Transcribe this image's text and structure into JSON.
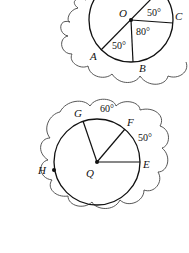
{
  "diagram": {
    "top_circle": {
      "center_label": "O",
      "points": {
        "A": "A",
        "B": "B",
        "C": "C"
      },
      "angles": {
        "upper_right": "50°",
        "right_lower": "80°",
        "lower_left": "50°"
      }
    },
    "bottom_circle": {
      "center_label": "Q",
      "points": {
        "E": "E",
        "F": "F",
        "G": "G",
        "H": "H"
      },
      "angles": {
        "arc_GF": "60°",
        "arc_FE": "50°"
      }
    }
  }
}
